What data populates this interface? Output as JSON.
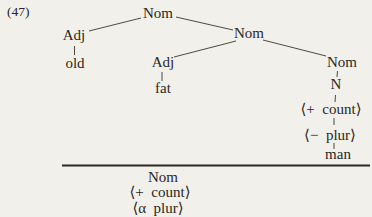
{
  "figure": {
    "example_number": "(47)",
    "background_color": "#f1f0ea",
    "ink_color": "#29271f"
  },
  "tree": {
    "root": {
      "label": "Nom"
    },
    "adj_left": {
      "label": "Adj"
    },
    "adj_left_terminal": {
      "label": "old"
    },
    "nom_mid": {
      "label": "Nom"
    },
    "adj_mid": {
      "label": "Adj"
    },
    "adj_mid_terminal": {
      "label": "fat"
    },
    "nom_right": {
      "label": "Nom"
    },
    "n_node": {
      "label": "N"
    },
    "feature_count": {
      "label": "⟨+  count⟩"
    },
    "feature_plur": {
      "label": "⟨−  plur⟩"
    },
    "terminal_man": {
      "label": "man"
    }
  },
  "result": {
    "category": "Nom",
    "feature_count": "⟨+  count⟩",
    "feature_plur": "⟨α  plur⟩"
  }
}
